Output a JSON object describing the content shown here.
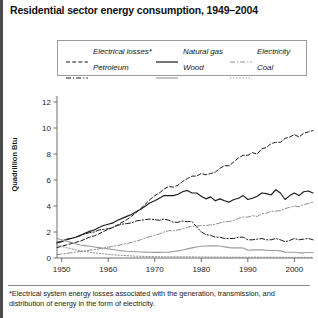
{
  "title": "Residential sector energy consumption, 1949–2004",
  "footnote": "*Electrical system energy losses associated with the generation, transmission, and distribution of energy in the form of electricity.",
  "legend": {
    "items": [
      {
        "label": "Electrical losses*",
        "style": "dashed",
        "color": "#1a1a1a",
        "row": 0,
        "col": 0
      },
      {
        "label": "Natural gas",
        "style": "solid",
        "color": "#1a1a1a",
        "row": 0,
        "col": 1
      },
      {
        "label": "Electricity",
        "style": "dashdot",
        "color": "#8e8e8e",
        "row": 0,
        "col": 2
      },
      {
        "label": "Petroleum",
        "style": "dashdot",
        "color": "#1a1a1a",
        "row": 1,
        "col": 0
      },
      {
        "label": "Wood",
        "style": "solid",
        "color": "#9a9a9a",
        "row": 1,
        "col": 1
      },
      {
        "label": "Coal",
        "style": "dotted",
        "color": "#8e8e8e",
        "row": 1,
        "col": 2
      }
    ]
  },
  "chart_data": {
    "type": "line",
    "title": "Residential sector energy consumption, 1949–2004",
    "xlabel": "",
    "ylabel": "Quadrillion Btu",
    "xlim": [
      1949,
      2004
    ],
    "ylim": [
      0,
      12
    ],
    "yticks": [
      0,
      2,
      4,
      6,
      8,
      10,
      12
    ],
    "xticks": [
      1950,
      1960,
      1970,
      1980,
      1990,
      2000
    ],
    "grid": false,
    "legend_position": "above-plot",
    "x": [
      1949,
      1950,
      1951,
      1952,
      1953,
      1954,
      1955,
      1956,
      1957,
      1958,
      1959,
      1960,
      1961,
      1962,
      1963,
      1964,
      1965,
      1966,
      1967,
      1968,
      1969,
      1970,
      1971,
      1972,
      1973,
      1974,
      1975,
      1976,
      1977,
      1978,
      1979,
      1980,
      1981,
      1982,
      1983,
      1984,
      1985,
      1986,
      1987,
      1988,
      1989,
      1990,
      1991,
      1992,
      1993,
      1994,
      1995,
      1996,
      1997,
      1998,
      1999,
      2000,
      2001,
      2002,
      2003,
      2004
    ],
    "series": [
      {
        "name": "Electrical losses*",
        "style": "dashed",
        "color": "#1a1a1a",
        "values": [
          0.8,
          0.9,
          1.0,
          1.1,
          1.2,
          1.3,
          1.45,
          1.6,
          1.7,
          1.85,
          2.05,
          2.2,
          2.35,
          2.55,
          2.75,
          2.95,
          3.2,
          3.5,
          3.8,
          4.15,
          4.5,
          4.8,
          5.0,
          5.3,
          5.5,
          5.45,
          5.6,
          5.9,
          6.1,
          6.3,
          6.3,
          6.5,
          6.4,
          6.5,
          6.6,
          6.9,
          7.1,
          7.1,
          7.4,
          7.7,
          7.9,
          7.9,
          8.1,
          8.0,
          8.4,
          8.5,
          8.8,
          8.9,
          8.9,
          9.2,
          9.3,
          9.5,
          9.3,
          9.6,
          9.7,
          9.8
        ]
      },
      {
        "name": "Natural gas",
        "style": "solid",
        "color": "#1a1a1a",
        "values": [
          1.15,
          1.25,
          1.4,
          1.5,
          1.6,
          1.75,
          1.9,
          2.05,
          2.15,
          2.35,
          2.5,
          2.6,
          2.7,
          2.9,
          3.05,
          3.2,
          3.35,
          3.55,
          3.75,
          4.0,
          4.25,
          4.4,
          4.6,
          4.8,
          4.8,
          4.8,
          4.9,
          5.1,
          5.2,
          5.0,
          5.0,
          4.75,
          4.55,
          4.7,
          4.4,
          4.55,
          4.4,
          4.3,
          4.5,
          4.6,
          4.8,
          4.5,
          4.6,
          4.75,
          5.0,
          4.95,
          4.85,
          5.25,
          5.0,
          4.5,
          4.8,
          5.0,
          4.8,
          5.1,
          5.15,
          5.0
        ]
      },
      {
        "name": "Petroleum",
        "style": "dashdot",
        "color": "#1a1a1a",
        "values": [
          1.2,
          1.3,
          1.45,
          1.5,
          1.6,
          1.7,
          1.85,
          1.95,
          2.0,
          2.15,
          2.2,
          2.25,
          2.35,
          2.5,
          2.6,
          2.65,
          2.7,
          2.85,
          2.9,
          2.95,
          3.0,
          2.95,
          2.9,
          3.0,
          2.9,
          2.75,
          2.75,
          2.85,
          2.8,
          2.8,
          2.4,
          2.0,
          1.8,
          1.75,
          1.6,
          1.6,
          1.5,
          1.5,
          1.5,
          1.6,
          1.6,
          1.4,
          1.4,
          1.45,
          1.5,
          1.4,
          1.4,
          1.5,
          1.4,
          1.25,
          1.35,
          1.5,
          1.4,
          1.45,
          1.5,
          1.4
        ]
      },
      {
        "name": "Electricity",
        "style": "dashdot",
        "color": "#8e8e8e",
        "values": [
          0.25,
          0.3,
          0.35,
          0.4,
          0.45,
          0.5,
          0.55,
          0.6,
          0.65,
          0.7,
          0.78,
          0.83,
          0.9,
          0.95,
          1.05,
          1.12,
          1.2,
          1.3,
          1.4,
          1.55,
          1.65,
          1.75,
          1.85,
          2.0,
          2.1,
          2.1,
          2.15,
          2.25,
          2.35,
          2.45,
          2.45,
          2.5,
          2.5,
          2.55,
          2.6,
          2.7,
          2.8,
          2.8,
          2.9,
          3.05,
          3.15,
          3.15,
          3.25,
          3.2,
          3.4,
          3.45,
          3.6,
          3.6,
          3.65,
          3.8,
          3.9,
          4.0,
          3.95,
          4.1,
          4.2,
          4.3
        ]
      },
      {
        "name": "Wood",
        "style": "solid",
        "color": "#9a9a9a",
        "values": [
          1.5,
          1.4,
          1.3,
          1.2,
          1.1,
          1.0,
          0.95,
          0.9,
          0.85,
          0.8,
          0.75,
          0.7,
          0.65,
          0.6,
          0.55,
          0.52,
          0.5,
          0.48,
          0.46,
          0.45,
          0.44,
          0.43,
          0.43,
          0.44,
          0.45,
          0.5,
          0.55,
          0.62,
          0.7,
          0.78,
          0.85,
          0.9,
          0.92,
          0.93,
          0.93,
          0.92,
          0.86,
          0.8,
          0.78,
          0.78,
          0.77,
          0.6,
          0.62,
          0.62,
          0.62,
          0.6,
          0.58,
          0.58,
          0.55,
          0.45,
          0.44,
          0.44,
          0.4,
          0.4,
          0.42,
          0.42
        ]
      },
      {
        "name": "Coal",
        "style": "dotted",
        "color": "#8e8e8e",
        "values": [
          1.0,
          0.9,
          0.8,
          0.72,
          0.63,
          0.55,
          0.5,
          0.45,
          0.4,
          0.36,
          0.32,
          0.28,
          0.25,
          0.22,
          0.2,
          0.18,
          0.16,
          0.14,
          0.13,
          0.12,
          0.11,
          0.1,
          0.1,
          0.09,
          0.09,
          0.09,
          0.09,
          0.09,
          0.09,
          0.09,
          0.08,
          0.08,
          0.08,
          0.07,
          0.07,
          0.07,
          0.07,
          0.06,
          0.06,
          0.06,
          0.06,
          0.06,
          0.06,
          0.06,
          0.06,
          0.06,
          0.06,
          0.06,
          0.06,
          0.05,
          0.05,
          0.05,
          0.05,
          0.05,
          0.05,
          0.05
        ]
      }
    ]
  }
}
